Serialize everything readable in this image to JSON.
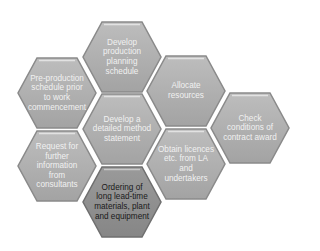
{
  "diagram": {
    "type": "hexagon-cluster",
    "colors": {
      "hex_fill": "#a9a9a9",
      "hex_fill_light": "#b9b9b9",
      "hex_border": "#8a8a8a",
      "hex_highlight": "#dcdcdc",
      "hex_dark_fill": "#8f8f8f",
      "text_light": "#f1f1f1",
      "text_dark": "#1a1a1a"
    },
    "hexagons": [
      {
        "id": "develop-production-planning-schedule",
        "label": "Develop\nproduction\nplanning\nschedule",
        "dark": false
      },
      {
        "id": "pre-production-schedule",
        "label": "Pre-production\nschedule prior\nto work\ncommencement",
        "dark": false
      },
      {
        "id": "allocate-resources",
        "label": "Allocate\nresources",
        "dark": false
      },
      {
        "id": "develop-method-statement",
        "label": "Develop a\ndetailed method\nstatement",
        "dark": false
      },
      {
        "id": "check-contract-award",
        "label": "Check\nconditions of\ncontract award",
        "dark": false
      },
      {
        "id": "request-further-information",
        "label": "Request for\nfurther\ninformation\nfrom\nconsultants",
        "dark": false
      },
      {
        "id": "obtain-licences",
        "label": "Obtain licences\netc. from LA\nand\nundertakers",
        "dark": false
      },
      {
        "id": "ordering-long-lead-time",
        "label": "Ordering of\nlong lead-time\nmaterials, plant\nand equipment",
        "dark": true
      }
    ]
  }
}
